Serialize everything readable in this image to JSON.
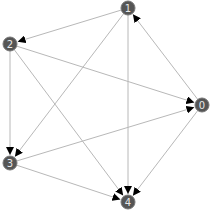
{
  "graph": {
    "type": "directed",
    "node_color": "#555555",
    "edge_color": "#b8b8b8",
    "label_color": "#e8e8e8",
    "nodes": [
      {
        "id": "0",
        "label": "0",
        "x": 202,
        "y": 105
      },
      {
        "id": "1",
        "label": "1",
        "x": 128,
        "y": 8
      },
      {
        "id": "2",
        "label": "2",
        "x": 10,
        "y": 44
      },
      {
        "id": "3",
        "label": "3",
        "x": 10,
        "y": 163
      },
      {
        "id": "4",
        "label": "4",
        "x": 128,
        "y": 202
      }
    ],
    "edges": [
      {
        "from": "0",
        "to": "1"
      },
      {
        "from": "1",
        "to": "2"
      },
      {
        "from": "1",
        "to": "3"
      },
      {
        "from": "1",
        "to": "4"
      },
      {
        "from": "2",
        "to": "0"
      },
      {
        "from": "2",
        "to": "3"
      },
      {
        "from": "2",
        "to": "4"
      },
      {
        "from": "3",
        "to": "0"
      },
      {
        "from": "3",
        "to": "4"
      },
      {
        "from": "0",
        "to": "4"
      }
    ]
  }
}
